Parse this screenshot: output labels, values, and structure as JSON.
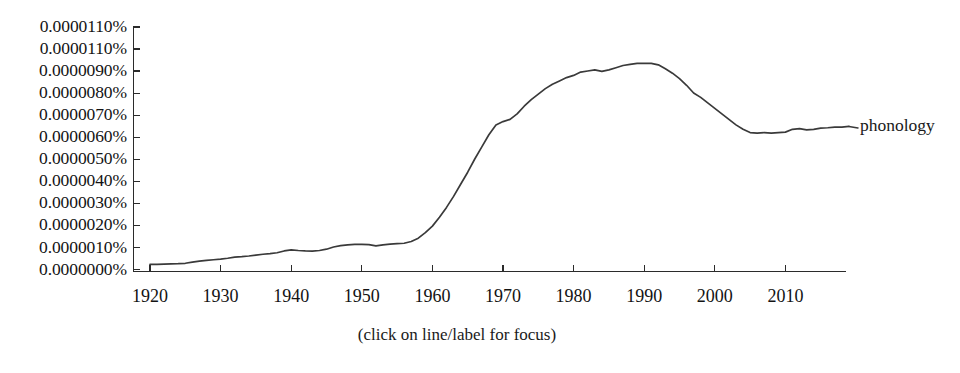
{
  "chart_data": {
    "type": "line",
    "title": "",
    "subtitle": "",
    "xlabel": "",
    "ylabel": "",
    "grid": false,
    "legend_position": "right-inline",
    "xlim": [
      1918,
      2019
    ],
    "ylim": [
      0.0,
      1.1e-05
    ],
    "x_tick_labels": [
      "1920",
      "1930",
      "1940",
      "1950",
      "1960",
      "1970",
      "1980",
      "1990",
      "2000",
      "2010"
    ],
    "x_ticks": [
      1920,
      1930,
      1940,
      1950,
      1960,
      1970,
      1980,
      1990,
      2000,
      2010
    ],
    "y_tick_labels": [
      "0.0000110%",
      "0.0000110%",
      "0.0000090%",
      "0.0000080%",
      "0.0000070%",
      "0.0000060%",
      "0.0000050%",
      "0.0000040%",
      "0.0000030%",
      "0.0000020%",
      "0.0000010%",
      "0.0000000%"
    ],
    "y_ticks": [
      1.1e-05,
      1e-05,
      9e-06,
      8e-06,
      7e-06,
      6e-06,
      5e-06,
      4e-06,
      3e-06,
      2e-06,
      1e-06,
      0.0
    ],
    "series": [
      {
        "name": "phonology",
        "color": "#3a3a3a",
        "x": [
          1920,
          1921,
          1922,
          1923,
          1924,
          1925,
          1926,
          1927,
          1928,
          1929,
          1930,
          1931,
          1932,
          1933,
          1934,
          1935,
          1936,
          1937,
          1938,
          1939,
          1940,
          1941,
          1942,
          1943,
          1944,
          1945,
          1946,
          1947,
          1948,
          1949,
          1950,
          1951,
          1952,
          1953,
          1954,
          1955,
          1956,
          1957,
          1958,
          1959,
          1960,
          1961,
          1962,
          1963,
          1964,
          1965,
          1966,
          1967,
          1968,
          1969,
          1970,
          1971,
          1972,
          1973,
          1974,
          1975,
          1976,
          1977,
          1978,
          1979,
          1980,
          1981,
          1982,
          1983,
          1984,
          1985,
          1986,
          1987,
          1988,
          1989,
          1990,
          1991,
          1992,
          1993,
          1994,
          1995,
          1996,
          1997,
          1998,
          1999,
          2000,
          2001,
          2002,
          2003,
          2004,
          2005,
          2006,
          2007,
          2008,
          2009,
          2010,
          2011,
          2012,
          2013,
          2014,
          2015,
          2016,
          2017,
          2018,
          2019
        ],
        "values": [
          2.1e-07,
          2.1e-07,
          2.2e-07,
          2.3e-07,
          2.4e-07,
          2.6e-07,
          3.1e-07,
          3.6e-07,
          3.9e-07,
          4.2e-07,
          4.5e-07,
          4.9e-07,
          5.4e-07,
          5.6e-07,
          5.9e-07,
          6.3e-07,
          6.7e-07,
          7e-07,
          7.4e-07,
          8.2e-07,
          8.7e-07,
          8.4e-07,
          8.2e-07,
          8.1e-07,
          8.4e-07,
          9e-07,
          1e-06,
          1.06e-06,
          1.1e-06,
          1.12e-06,
          1.12e-06,
          1.11e-06,
          1.05e-06,
          1.1e-06,
          1.13e-06,
          1.15e-06,
          1.17e-06,
          1.25e-06,
          1.4e-06,
          1.65e-06,
          1.95e-06,
          2.35e-06,
          2.8e-06,
          3.3e-06,
          3.85e-06,
          4.4e-06,
          5e-06,
          5.55e-06,
          6.1e-06,
          6.55e-06,
          6.7e-06,
          6.8e-06,
          7.05e-06,
          7.4e-06,
          7.7e-06,
          7.95e-06,
          8.2e-06,
          8.4e-06,
          8.55e-06,
          8.7e-06,
          8.8e-06,
          8.95e-06,
          9e-06,
          9.05e-06,
          8.98e-06,
          9.05e-06,
          9.15e-06,
          9.25e-06,
          9.3e-06,
          9.35e-06,
          9.35e-06,
          9.35e-06,
          9.28e-06,
          9.1e-06,
          8.9e-06,
          8.65e-06,
          8.35e-06,
          8e-06,
          7.8e-06,
          7.55e-06,
          7.3e-06,
          7.05e-06,
          6.8e-06,
          6.55e-06,
          6.35e-06,
          6.2e-06,
          6.18e-06,
          6.2e-06,
          6.18e-06,
          6.2e-06,
          6.22e-06,
          6.35e-06,
          6.38e-06,
          6.32e-06,
          6.35e-06,
          6.4e-06,
          6.42e-06,
          6.45e-06,
          6.45e-06,
          6.48e-06
        ]
      }
    ],
    "annotations": [
      "(click on line/label for focus)"
    ]
  },
  "legend": {
    "phonology_label": "phonology"
  },
  "footer": {
    "hint": "(click on line/label for focus)"
  },
  "colors": {
    "line": "#3a3a3a",
    "axis": "#2b2b2b",
    "text": "#131313",
    "background": "#ffffff"
  }
}
